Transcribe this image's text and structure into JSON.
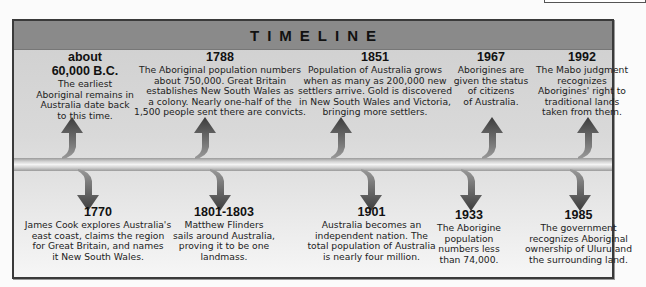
{
  "title": "TIMELINE",
  "colors": {
    "header": "#8a8a8a",
    "body": "#d9d9d9",
    "frame": "#3a3a3a",
    "arrow": "#4a4a4a"
  },
  "events_above": [
    {
      "year_line1": "about",
      "year": "60,000 B.C.",
      "text": "The earliest\nAboriginal remains in\nAustralia date back\nto this time."
    },
    {
      "year": "1788",
      "text": "The Aboriginal population numbers\nabout 750,000. Great Britain\nestablishes New South Wales as\na colony. Nearly one-half of the\n1,500 people sent there are convicts."
    },
    {
      "year": "1851",
      "text": "Population of Australia grows\nwhen as many as 200,000 new\nsettlers arrive. Gold is discovered\nin New South Wales and Victoria,\nbringing more settlers."
    },
    {
      "year": "1967",
      "text": "Aborigines are\ngiven the status\nof citizens\nof Australia."
    },
    {
      "year": "1992",
      "text": "The Mabo judgment\nrecognizes\nAborigines' right to\ntraditional lands\ntaken from them."
    }
  ],
  "events_below": [
    {
      "year": "1770",
      "text": "James Cook explores Australia's\neast coast, claims the region\nfor Great Britain, and names\nit New South Wales."
    },
    {
      "year": "1801-1803",
      "text": "Matthew Flinders\nsails around Australia,\nproving it to be one\nlandmass."
    },
    {
      "year": "1901",
      "text": "Australia becomes an\nindependent nation. The\ntotal population of Australia\nis nearly four million."
    },
    {
      "year": "1933",
      "text": "The Aborigine\npopulation\nnumbers less\nthan 74,000."
    },
    {
      "year": "1985",
      "text": "The government\nrecognizes Aboriginal\nownership of Uluru and\nthe surrounding land."
    }
  ]
}
